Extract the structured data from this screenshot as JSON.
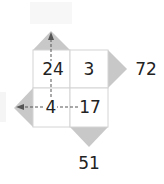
{
  "puzzle": {
    "cells": {
      "top_left": "24",
      "top_right": "3",
      "bottom_left": "4",
      "bottom_right": "17"
    },
    "outputs": {
      "right": "72",
      "bottom": "51",
      "top": "",
      "left": ""
    },
    "colors": {
      "triangle": "#c8c8c8",
      "grid_line": "#d4d4d4",
      "arrow": "#555555",
      "text": "#222222"
    }
  }
}
